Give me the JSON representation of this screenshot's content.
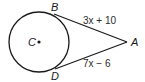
{
  "diagram": {
    "type": "circle-with-tangent-segments",
    "circle": {
      "center_label": "C",
      "cx": 39,
      "cy": 42,
      "r": 30
    },
    "points": {
      "A": {
        "label": "A",
        "x": 127,
        "y": 42
      },
      "B": {
        "label": "B",
        "x": 54,
        "y": 14
      },
      "D": {
        "label": "D",
        "x": 55,
        "y": 69
      }
    },
    "segments": [
      {
        "from": "B",
        "to": "A",
        "expression": "3x + 10"
      },
      {
        "from": "D",
        "to": "A",
        "expression": "7x − 6"
      }
    ],
    "colors": {
      "stroke": "#1a1a1a",
      "background": "#ffffff"
    }
  }
}
